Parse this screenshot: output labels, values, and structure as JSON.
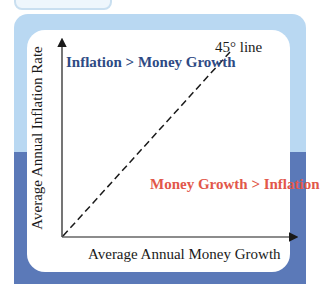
{
  "diagram": {
    "region_upper_label": "Inflation > Money Growth",
    "region_lower_label": "Money Growth > Inflation",
    "reference_line_label": "45° line",
    "x_axis_label": "Average Annual Money Growth",
    "y_axis_label": "Average Annual Inflation Rate"
  },
  "colors": {
    "frame_top": "#b9d8f2",
    "frame_bottom": "#5b79b8",
    "upper_label": "#2e4a84",
    "lower_label": "#e2574a",
    "axis": "#1a1a1a"
  }
}
